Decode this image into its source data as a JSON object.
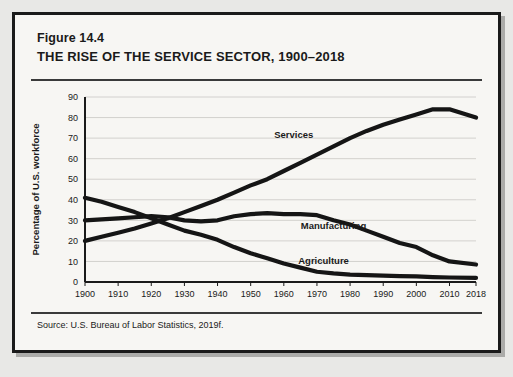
{
  "figure": {
    "number": "Figure 14.4",
    "title": "THE RISE OF THE SERVICE SECTOR, 1900–2018",
    "source": "Source: U.S. Bureau of Labor Statistics, 2019f."
  },
  "colors": {
    "page_background": "#e8e8e6",
    "card_background": "#f7f6f3",
    "frame": "#1a1a1a",
    "line": "#151515",
    "gridline": "#c9c8c4",
    "text": "#1a1a1a"
  },
  "chart_data": {
    "type": "line",
    "title": "THE RISE OF THE SERVICE SECTOR, 1900–2018",
    "xlabel": "",
    "ylabel": "Percentage of U.S. workforce",
    "xlim": [
      1900,
      2018
    ],
    "ylim": [
      0,
      90
    ],
    "yticks": [
      0,
      10,
      20,
      30,
      40,
      50,
      60,
      70,
      80,
      90
    ],
    "xticks": [
      1900,
      1910,
      1920,
      1930,
      1940,
      1950,
      1960,
      1970,
      1980,
      1990,
      2000,
      2010,
      2018
    ],
    "xtick_labels": [
      "1900",
      "1910",
      "1920",
      "1930",
      "1940",
      "1950",
      "1960",
      "1970",
      "1980",
      "1990",
      "2000",
      "2010",
      "2018"
    ],
    "ytick_labels": [
      "0",
      "10",
      "20",
      "30",
      "40",
      "50",
      "60",
      "70",
      "80",
      "90"
    ],
    "grid": true,
    "legend": "inline-labels",
    "x": [
      1900,
      1905,
      1910,
      1915,
      1920,
      1925,
      1930,
      1935,
      1940,
      1945,
      1950,
      1955,
      1960,
      1965,
      1970,
      1975,
      1980,
      1985,
      1990,
      1995,
      2000,
      2005,
      2010,
      2018
    ],
    "series": [
      {
        "name": "Services",
        "label": "Services",
        "label_x": 1963,
        "label_y": 70,
        "values": [
          20,
          22,
          24,
          26,
          28.5,
          31,
          34,
          37,
          40,
          43.5,
          47,
          50,
          54,
          58,
          62,
          66,
          70,
          73.5,
          76.5,
          79,
          81.5,
          84,
          84,
          80
        ]
      },
      {
        "name": "Manufacturing",
        "label": "Manufacturing",
        "label_x": 1975,
        "label_y": 26,
        "values": [
          30,
          30.5,
          31,
          31.5,
          32,
          31.5,
          30,
          29.5,
          30,
          32,
          33,
          33.5,
          33,
          33,
          32.5,
          30,
          28,
          25,
          22,
          19,
          17,
          13,
          10,
          8.5
        ]
      },
      {
        "name": "Agriculture",
        "label": "Agriculture",
        "label_x": 1972,
        "label_y": 9,
        "values": [
          41,
          39,
          36.5,
          34,
          31,
          28,
          25,
          23,
          20.5,
          17,
          14,
          11.5,
          9,
          7,
          5,
          4.2,
          3.6,
          3.3,
          3.1,
          2.9,
          2.7,
          2.4,
          2.2,
          2
        ]
      }
    ]
  }
}
